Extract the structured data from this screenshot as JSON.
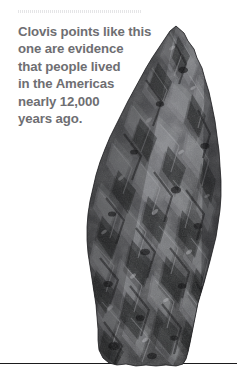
{
  "page": {
    "background_color": "#ffffff",
    "width": 237,
    "height": 387
  },
  "top_rule": {
    "style": "dotted",
    "color": "#e4e4e6"
  },
  "caption": {
    "text_color": "#6e6e72",
    "full_text": "Clovis points like this one are evidence that people lived in the Americas nearly 12,000 years ago.",
    "lines": [
      "Clovis points like this",
      "one are evidence",
      "that people lived",
      "in the Americas",
      "nearly 12,000",
      "years ago."
    ]
  },
  "figure": {
    "stone_dark_color": "#2a2a2c",
    "stone_mid_color": "#55565a",
    "stone_light_color": "#9a9b9f"
  },
  "bottom_rule": {
    "color": "#1b1b1d"
  }
}
